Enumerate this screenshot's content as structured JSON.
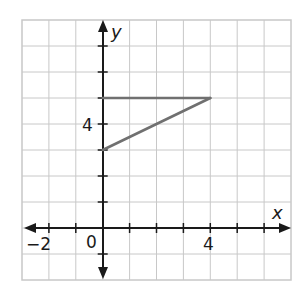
{
  "chart_data": {
    "type": "line",
    "title": "",
    "xlabel": "x",
    "ylabel": "y",
    "xlim": [
      -3,
      7
    ],
    "ylim": [
      -2,
      8
    ],
    "grid": true,
    "grid_step": 1,
    "x_tick_labels": [
      {
        "value": -2,
        "label": "−2"
      },
      {
        "value": 0,
        "label": "0"
      },
      {
        "value": 4,
        "label": "4"
      }
    ],
    "y_tick_labels": [
      {
        "value": 4,
        "label": "4"
      }
    ],
    "series": [
      {
        "name": "segment-horizontal",
        "points": [
          [
            0,
            5
          ],
          [
            4,
            5
          ]
        ]
      },
      {
        "name": "segment-sloped",
        "points": [
          [
            0,
            3
          ],
          [
            4,
            5
          ]
        ]
      }
    ],
    "colors": {
      "segments": "#707070",
      "grid": "#c8c8c8",
      "axes": "#1a1a1a"
    }
  },
  "labels": {
    "x_axis": "x",
    "y_axis": "y",
    "origin": "0",
    "x_neg2": "−2",
    "x_4": "4",
    "y_4": "4"
  }
}
